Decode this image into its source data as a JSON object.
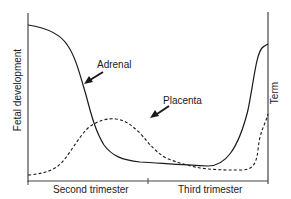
{
  "diagram": {
    "y_axis_label": "Fetal development",
    "term_label": "Term",
    "x_segments": [
      {
        "label": "Second trimester"
      },
      {
        "label": "Third trimester"
      }
    ],
    "curves": [
      {
        "name": "Adrenal",
        "style": "solid",
        "label": "Adrenal"
      },
      {
        "name": "Placenta",
        "style": "dashed",
        "label": "Placenta"
      }
    ],
    "colors": {
      "line": "#1a1a1a",
      "axis": "#333333",
      "background": "#ffffff"
    }
  }
}
